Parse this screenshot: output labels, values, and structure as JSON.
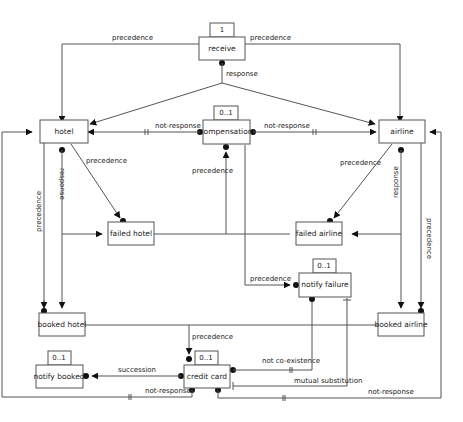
{
  "diagram": {
    "type": "declare-constraint-model",
    "nodes": {
      "receive": {
        "label": "receive",
        "cardinality": "1"
      },
      "hotel": {
        "label": "hotel"
      },
      "compensation": {
        "label": "compensation",
        "cardinality": "0..1"
      },
      "airline": {
        "label": "airline"
      },
      "failed_hotel": {
        "label": "failed hotel"
      },
      "failed_airline": {
        "label": "failed airline"
      },
      "notify_failure": {
        "label": "notify failure",
        "cardinality": "0..1"
      },
      "booked_hotel": {
        "label": "booked hotel"
      },
      "booked_airline": {
        "label": "booked airline"
      },
      "notify_booked": {
        "label": "notify booked",
        "cardinality": "0..1"
      },
      "credit_card": {
        "label": "credit card",
        "cardinality": "0..1"
      }
    },
    "edges": {
      "receive_hotel": {
        "label": "precedence",
        "from": "receive",
        "to": "hotel"
      },
      "receive_airline": {
        "label": "precedence",
        "from": "receive",
        "to": "airline"
      },
      "receive_response": {
        "label": "response",
        "from": "receive",
        "to": "hotel, airline"
      },
      "comp_hotel": {
        "label": "not-response",
        "from": "compensation",
        "to": "hotel"
      },
      "comp_airline": {
        "label": "not-response",
        "from": "compensation",
        "to": "airline"
      },
      "hotel_failed": {
        "label": "precedence",
        "from": "hotel",
        "to": "failed hotel"
      },
      "airline_failed": {
        "label": "precedence",
        "from": "airline",
        "to": "failed airline"
      },
      "failed_comp": {
        "label": "precedence",
        "from": "failed hotel, failed airline",
        "to": "compensation"
      },
      "hotel_response": {
        "label": "response",
        "from": "hotel",
        "to": "booked hotel, failed hotel"
      },
      "hotel_booked": {
        "label": "precedence",
        "from": "hotel",
        "to": "booked hotel"
      },
      "airline_response": {
        "label": "response",
        "from": "airline",
        "to": "booked airline, failed airline"
      },
      "airline_booked": {
        "label": "precedence",
        "from": "airline",
        "to": "booked airline"
      },
      "failed_notify": {
        "label": "precedence",
        "from": "failed hotel, failed airline",
        "to": "notify failure"
      },
      "booked_cc": {
        "label": "precedence",
        "from": "booked hotel, booked airline",
        "to": "credit card"
      },
      "cc_notify_booked": {
        "label": "succession",
        "from": "credit card",
        "to": "notify booked"
      },
      "cc_notify_failure_coex": {
        "label": "not co-existence",
        "from": "credit card",
        "to": "notify failure"
      },
      "cc_notify_failure_sub": {
        "label": "mutual substitution",
        "from": "credit card",
        "to": "notify failure"
      },
      "cc_hotel_notresp": {
        "label": "not-response",
        "from": "credit card",
        "to": "hotel"
      },
      "cc_airline_notresp": {
        "label": "not-response",
        "from": "credit card",
        "to": "airline"
      }
    }
  }
}
